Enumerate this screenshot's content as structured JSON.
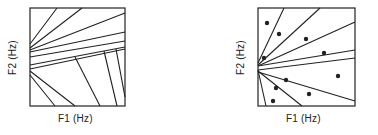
{
  "figure": {
    "panels": [
      {
        "id": "left",
        "xlabel": "F1 (Hz)",
        "ylabel": "F2 (Hz)",
        "box": {
          "x": 30,
          "y": 8,
          "w": 95,
          "h": 98
        },
        "lines": [
          [
            0,
            36,
            27,
            0
          ],
          [
            0,
            40,
            52,
            0
          ],
          [
            0,
            42,
            95,
            5
          ],
          [
            0,
            44,
            95,
            24
          ],
          [
            0,
            49,
            95,
            33
          ],
          [
            0,
            57,
            95,
            39
          ],
          [
            0,
            61,
            95,
            41
          ],
          [
            25,
            98,
            0,
            67
          ],
          [
            45,
            98,
            0,
            63
          ],
          [
            70,
            98,
            45,
            49
          ],
          [
            87,
            98,
            74,
            43
          ],
          [
            95,
            89,
            86,
            41
          ]
        ]
      },
      {
        "id": "right",
        "xlabel": "F1 (Hz)",
        "ylabel": "F2 (Hz)",
        "box": {
          "x": 258,
          "y": 8,
          "w": 97,
          "h": 98
        },
        "lines": [
          [
            0,
            55,
            26,
            0
          ],
          [
            0,
            57,
            62,
            0
          ],
          [
            0,
            58,
            97,
            14
          ],
          [
            0,
            58,
            97,
            42
          ],
          [
            0,
            62,
            97,
            50
          ],
          [
            0,
            62,
            8,
            98
          ],
          [
            0,
            63,
            44,
            98
          ],
          [
            0,
            64,
            97,
            93
          ]
        ],
        "dots": [
          [
            9,
            15
          ],
          [
            21,
            26
          ],
          [
            48,
            31
          ],
          [
            66,
            45
          ],
          [
            6,
            50
          ],
          [
            28,
            72
          ],
          [
            80,
            68
          ],
          [
            18,
            80
          ],
          [
            51,
            86
          ],
          [
            15,
            93
          ]
        ]
      }
    ]
  }
}
